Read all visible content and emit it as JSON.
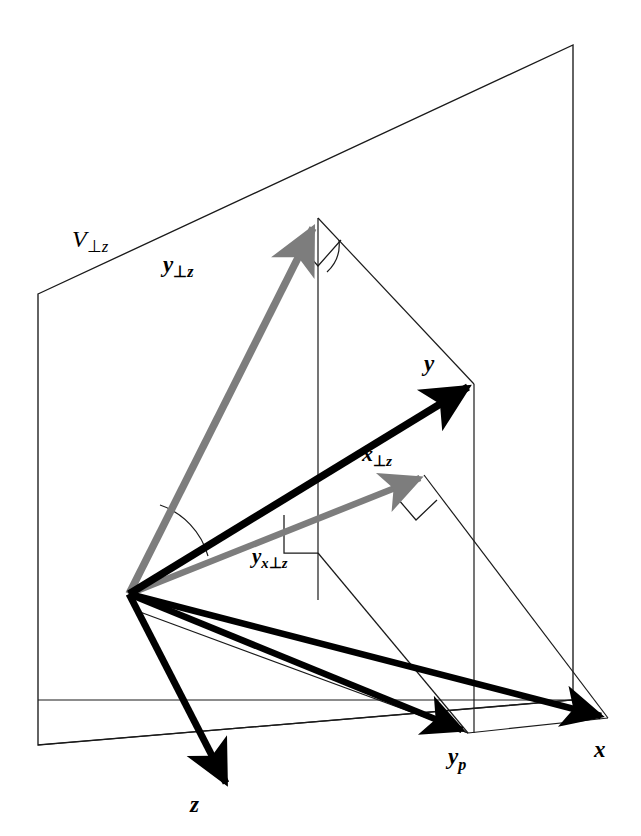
{
  "figure": {
    "background_color": "#ffffff",
    "vector_black_color": "#000000",
    "vector_gray_color": "#808080",
    "thin_line_color": "#1a1a1a",
    "plane_edge_color": "#1a1a1a"
  },
  "labels": {
    "plane": {
      "base": "V",
      "sub_perp": "⊥",
      "sub_var": "z",
      "full": "V⊥z"
    },
    "y_perp_z": {
      "base": "y",
      "sub_perp": "⊥",
      "sub_var": "z",
      "full": "y⊥z"
    },
    "x_perp_z": {
      "base": "x",
      "sub_perp": "⊥",
      "sub_var": "z",
      "full": "x⊥z"
    },
    "y_x_perp_z": {
      "base": "y",
      "sub_var1": "x",
      "sub_perp": "⊥",
      "sub_var2": "z",
      "full": "yx⊥z"
    },
    "y": {
      "base": "y",
      "full": "y"
    },
    "x": {
      "base": "x",
      "full": "x"
    },
    "z": {
      "base": "z",
      "full": "z"
    },
    "y_p": {
      "base": "y",
      "sub_var": "p",
      "full": "yp"
    }
  },
  "geometry": {
    "origin": {
      "x": 129,
      "y": 594
    },
    "plane_corners": {
      "top_left": {
        "x": 38,
        "y": 294
      },
      "top_right": {
        "x": 573,
        "y": 45
      },
      "bottom_right": {
        "x": 573,
        "y": 700
      },
      "bottom_left": {
        "x": 38,
        "y": 745
      }
    },
    "vectors": [
      {
        "name": "y-perp-z",
        "color": "gray",
        "from": {
          "x": 129,
          "y": 594
        },
        "to": {
          "x": 318,
          "y": 218
        }
      },
      {
        "name": "y",
        "color": "black",
        "from": {
          "x": 129,
          "y": 594
        },
        "to": {
          "x": 474,
          "y": 384
        }
      },
      {
        "name": "x-perp-z",
        "color": "gray",
        "from": {
          "x": 129,
          "y": 594
        },
        "to": {
          "x": 424,
          "y": 475
        }
      },
      {
        "name": "x",
        "color": "black",
        "from": {
          "x": 129,
          "y": 594
        },
        "to": {
          "x": 608,
          "y": 718
        }
      },
      {
        "name": "y-p",
        "color": "black",
        "from": {
          "x": 129,
          "y": 594
        },
        "to": {
          "x": 468,
          "y": 733
        }
      },
      {
        "name": "z",
        "color": "black",
        "from": {
          "x": 129,
          "y": 594
        },
        "to": {
          "x": 230,
          "y": 790
        }
      }
    ],
    "thin_lines": [
      {
        "name": "y-perp-z-tip-to-y-tip",
        "from": {
          "x": 318,
          "y": 218
        },
        "to": {
          "x": 474,
          "y": 384
        }
      },
      {
        "name": "y-perp-z-tip-drop",
        "from": {
          "x": 318,
          "y": 218
        },
        "to": {
          "x": 318,
          "y": 553
        }
      },
      {
        "name": "y-tip-drop-to-yp",
        "from": {
          "x": 474,
          "y": 384
        },
        "to": {
          "x": 474,
          "y": 733
        }
      },
      {
        "name": "x-perp-z-tip-to-x-tip",
        "from": {
          "x": 424,
          "y": 475
        },
        "to": {
          "x": 608,
          "y": 718
        }
      },
      {
        "name": "plane-floor-left",
        "from": {
          "x": 38,
          "y": 700
        },
        "to": {
          "x": 573,
          "y": 700
        }
      },
      {
        "name": "yp-to-x",
        "from": {
          "x": 468,
          "y": 733
        },
        "to": {
          "x": 608,
          "y": 718
        }
      },
      {
        "name": "origin-to-yxpz",
        "from": {
          "x": 129,
          "y": 594
        },
        "to": {
          "x": 318,
          "y": 553
        }
      }
    ],
    "right_angle_markers": [
      {
        "name": "at-y-perp-z-tip",
        "x": 318,
        "y": 218
      },
      {
        "name": "at-y-x-perp-z",
        "x": 318,
        "y": 553
      },
      {
        "name": "at-x-perp-z-tip",
        "x": 424,
        "y": 475
      }
    ],
    "angle_arcs": [
      {
        "name": "angle-between-y-and-y-perp-z",
        "at_origin": true
      },
      {
        "name": "angle-at-top-vertex",
        "at_origin": false
      }
    ]
  },
  "label_positions": {
    "plane": {
      "x": 72,
      "y": 247
    },
    "y_perp_z": {
      "x": 163,
      "y": 272
    },
    "y": {
      "x": 424,
      "y": 371
    },
    "x_perp_z": {
      "x": 362,
      "y": 461
    },
    "y_x_perp_z": {
      "x": 252,
      "y": 563
    },
    "y_p": {
      "x": 454,
      "y": 764
    },
    "x": {
      "x": 598,
      "y": 757
    },
    "z": {
      "x": 196,
      "y": 810
    }
  }
}
